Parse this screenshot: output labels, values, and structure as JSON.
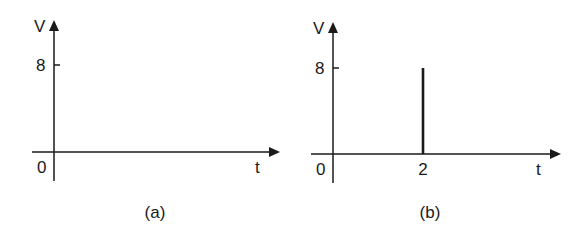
{
  "chart_data": [
    {
      "type": "line",
      "panel": "(a)",
      "title": "",
      "xlabel": "t",
      "ylabel": "V",
      "x_ticks": [],
      "y_ticks": [
        8
      ],
      "origin_label": "0",
      "xlim": [
        0,
        6
      ],
      "ylim": [
        0,
        10
      ],
      "grid": false,
      "series": []
    },
    {
      "type": "line",
      "panel": "(b)",
      "title": "",
      "xlabel": "t",
      "ylabel": "V",
      "x_ticks": [
        2
      ],
      "y_ticks": [
        8
      ],
      "origin_label": "0",
      "xlim": [
        0,
        5
      ],
      "ylim": [
        0,
        10
      ],
      "grid": false,
      "series": [
        {
          "name": "impulse",
          "kind": "vertical-line",
          "x": 2,
          "y_from": 0,
          "y_to": 8
        }
      ]
    }
  ],
  "labels": {
    "a": {
      "ylabel": "V",
      "xlabel": "t",
      "tick8": "8",
      "origin": "0",
      "caption": "(a)"
    },
    "b": {
      "ylabel": "V",
      "xlabel": "t",
      "tick8": "8",
      "tick2": "2",
      "origin": "0",
      "caption": "(b)"
    }
  }
}
